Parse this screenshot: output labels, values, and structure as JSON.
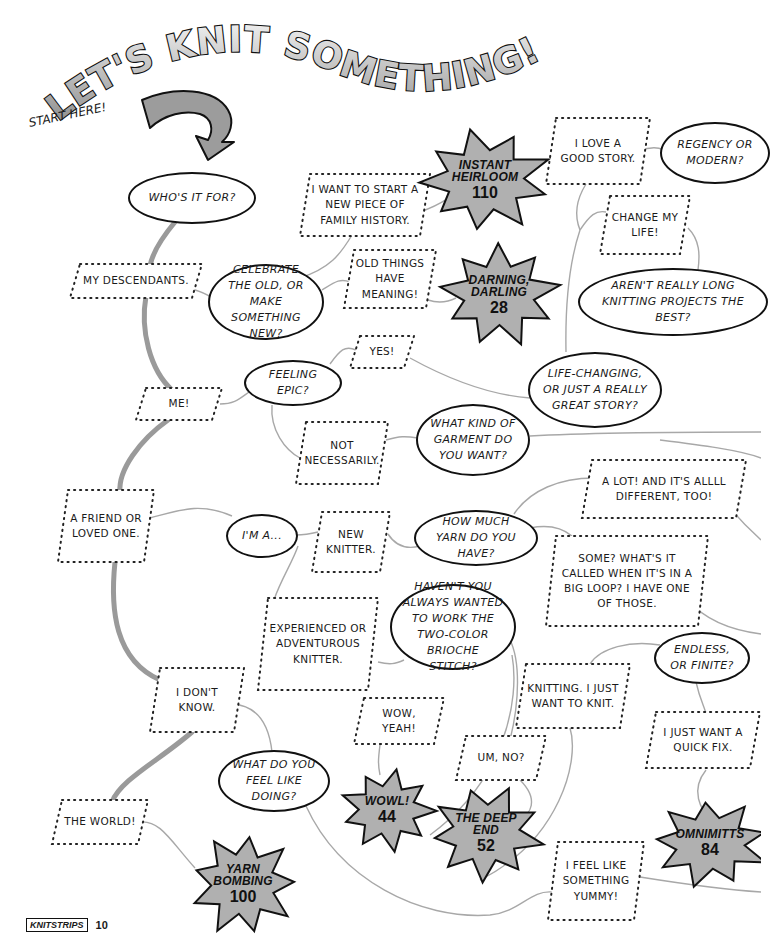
{
  "title": "LET'S KNIT SOMETHING!",
  "start_label": "START HERE!",
  "colors": {
    "burst_fill": "#b0b0b0",
    "trunk_line": "#9a9a9a",
    "connector": "#a8a8a8",
    "arrow_fill": "#9c9c9c"
  },
  "questions": [
    {
      "id": "who",
      "text": "WHO'S IT FOR?",
      "x": 128,
      "y": 172,
      "w": 128,
      "h": 52
    },
    {
      "id": "celebrate",
      "text": "CELEBRATE THE OLD, OR MAKE SOMETHING NEW?",
      "x": 208,
      "y": 264,
      "w": 116,
      "h": 76
    },
    {
      "id": "epic",
      "text": "FEELING EPIC?",
      "x": 244,
      "y": 360,
      "w": 98,
      "h": 46
    },
    {
      "id": "regency",
      "text": "REGENCY OR MODERN?",
      "x": 660,
      "y": 122,
      "w": 110,
      "h": 62
    },
    {
      "id": "long",
      "text": "AREN'T REALLY LONG KNITTING PROJECTS THE BEST?",
      "x": 578,
      "y": 268,
      "w": 190,
      "h": 68
    },
    {
      "id": "lifechanging",
      "text": "LIFE-CHANGING, OR JUST A REALLY GREAT STORY?",
      "x": 528,
      "y": 352,
      "w": 134,
      "h": 76
    },
    {
      "id": "garment",
      "text": "WHAT KIND OF GARMENT DO YOU WANT?",
      "x": 416,
      "y": 404,
      "w": 114,
      "h": 72
    },
    {
      "id": "yarn",
      "text": "HOW MUCH YARN DO YOU HAVE?",
      "x": 414,
      "y": 510,
      "w": 124,
      "h": 56
    },
    {
      "id": "im",
      "text": "I'M A...",
      "x": 226,
      "y": 514,
      "w": 72,
      "h": 44
    },
    {
      "id": "brioche",
      "text": "HAVEN'T YOU ALWAYS WANTED TO WORK THE TWO-COLOR BRIOCHE STITCH?",
      "x": 390,
      "y": 584,
      "w": 126,
      "h": 86
    },
    {
      "id": "endless",
      "text": "ENDLESS, OR FINITE?",
      "x": 654,
      "y": 632,
      "w": 96,
      "h": 52
    },
    {
      "id": "feel",
      "text": "WHAT DO YOU FEEL LIKE DOING?",
      "x": 218,
      "y": 750,
      "w": 112,
      "h": 62
    }
  ],
  "answers": [
    {
      "id": "descendants",
      "text": "MY DESCENDANTS.",
      "x": 70,
      "y": 264,
      "w": 132,
      "h": 34
    },
    {
      "id": "family",
      "text": "I WANT TO START A NEW PIECE OF FAMILY HISTORY.",
      "x": 300,
      "y": 174,
      "w": 130,
      "h": 62
    },
    {
      "id": "oldthings",
      "text": "OLD THINGS HAVE MEANING!",
      "x": 344,
      "y": 250,
      "w": 92,
      "h": 58
    },
    {
      "id": "goodstory",
      "text": "I LOVE A GOOD STORY.",
      "x": 546,
      "y": 118,
      "w": 104,
      "h": 66
    },
    {
      "id": "changelife",
      "text": "CHANGE MY LIFE!",
      "x": 600,
      "y": 196,
      "w": 90,
      "h": 58
    },
    {
      "id": "yes",
      "text": "YES!",
      "x": 350,
      "y": 336,
      "w": 64,
      "h": 32
    },
    {
      "id": "me",
      "text": "ME!",
      "x": 136,
      "y": 388,
      "w": 86,
      "h": 32
    },
    {
      "id": "notnecessarily",
      "text": "NOT NECESSARILY.",
      "x": 296,
      "y": 422,
      "w": 92,
      "h": 62
    },
    {
      "id": "alot",
      "text": "A LOT! AND IT'S ALLLL DIFFERENT, TOO!",
      "x": 582,
      "y": 460,
      "w": 164,
      "h": 58
    },
    {
      "id": "friend",
      "text": "A FRIEND OR LOVED ONE.",
      "x": 58,
      "y": 490,
      "w": 96,
      "h": 72
    },
    {
      "id": "newknitter",
      "text": "NEW KNITTER.",
      "x": 312,
      "y": 512,
      "w": 78,
      "h": 60
    },
    {
      "id": "some",
      "text": "SOME? WHAT'S IT CALLED WHEN IT'S IN A BIG LOOP? I HAVE ONE OF THOSE.",
      "x": 546,
      "y": 536,
      "w": 162,
      "h": 90
    },
    {
      "id": "experienced",
      "text": "EXPERIENCED OR ADVENTUROUS KNITTER.",
      "x": 258,
      "y": 598,
      "w": 120,
      "h": 92
    },
    {
      "id": "dontknow",
      "text": "I DON'T KNOW.",
      "x": 150,
      "y": 668,
      "w": 94,
      "h": 64
    },
    {
      "id": "knitting",
      "text": "KNITTING. I JUST WANT TO KNIT.",
      "x": 516,
      "y": 664,
      "w": 114,
      "h": 64
    },
    {
      "id": "wowyeah",
      "text": "WOW, YEAH!",
      "x": 354,
      "y": 698,
      "w": 90,
      "h": 46
    },
    {
      "id": "quickfix",
      "text": "I JUST WANT A QUICK FIX.",
      "x": 646,
      "y": 712,
      "w": 114,
      "h": 56
    },
    {
      "id": "umno",
      "text": "UM, NO?",
      "x": 456,
      "y": 736,
      "w": 90,
      "h": 44
    },
    {
      "id": "world",
      "text": "THE WORLD!",
      "x": 52,
      "y": 800,
      "w": 96,
      "h": 44
    },
    {
      "id": "yummy",
      "text": "I FEEL LIKE SOMETHING YUMMY!",
      "x": 548,
      "y": 842,
      "w": 96,
      "h": 78
    }
  ],
  "results": [
    {
      "id": "heirloom",
      "name": "INSTANT HEIRLOOM",
      "page": "110",
      "x": 420,
      "y": 130,
      "w": 130,
      "h": 100
    },
    {
      "id": "darning",
      "name": "DARNING, DARLING",
      "page": "28",
      "x": 440,
      "y": 245,
      "w": 118,
      "h": 100
    },
    {
      "id": "wow",
      "name": "WOWL!",
      "page": "44",
      "x": 340,
      "y": 770,
      "w": 94,
      "h": 80
    },
    {
      "id": "deepend",
      "name": "THE DEEP END",
      "page": "52",
      "x": 430,
      "y": 786,
      "w": 112,
      "h": 94
    },
    {
      "id": "omnimitts",
      "name": "OMNIMITTS",
      "page": "84",
      "x": 652,
      "y": 800,
      "w": 116,
      "h": 86
    },
    {
      "id": "yarnbombing",
      "name": "YARN BOMBING",
      "page": "100",
      "x": 190,
      "y": 834,
      "w": 106,
      "h": 100
    }
  ],
  "footer": {
    "badge": "KNITSTRIPS",
    "page_number": "10"
  }
}
